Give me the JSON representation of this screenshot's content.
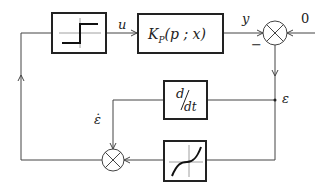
{
  "diagram": {
    "type": "block-diagram",
    "title": "",
    "blocks": {
      "relay": {
        "name": "relay nonlinearity",
        "symbol": "relay-step"
      },
      "plant": {
        "label_main": "K",
        "label_sub": "P",
        "label_args": "(p ; x)"
      },
      "derivative": {
        "num": "d",
        "den": "dt"
      },
      "nonlinear": {
        "name": "cubic-like nonlinearity",
        "symbol": "s-curve"
      }
    },
    "signals": {
      "u": "u",
      "y": "y",
      "reference": "0",
      "minus": "−",
      "epsilon": "ε",
      "epsilon_dot": "ε̇"
    },
    "summers": [
      {
        "id": "error-summer",
        "inputs": [
          "y",
          "0"
        ],
        "signs": [
          "-",
          "+"
        ]
      },
      {
        "id": "switch-summer",
        "inputs": [
          "ε̇",
          "f(ε)"
        ]
      }
    ]
  }
}
